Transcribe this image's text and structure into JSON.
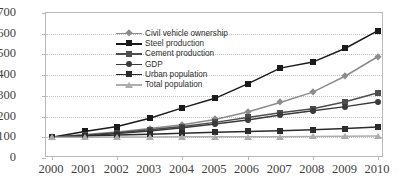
{
  "chart_data": {
    "type": "line",
    "title": "",
    "subtitle": "",
    "xlabel": "",
    "ylabel": "",
    "grid": true,
    "legend_position": "top-left inside plot",
    "x": [
      "2000",
      "2001",
      "2002",
      "2003",
      "2004",
      "2005",
      "2006",
      "2007",
      "2008",
      "2009",
      "2010"
    ],
    "categories": [
      "2000",
      "2001",
      "2002",
      "2003",
      "2004",
      "2005",
      "2006",
      "2007",
      "2008",
      "2009",
      "2010"
    ],
    "xlim": [
      2000,
      2010
    ],
    "ylim": [
      0,
      700
    ],
    "ytick_labels": [
      "700",
      "600",
      "500",
      "400",
      "300",
      "200",
      "100",
      "0"
    ],
    "ytick_values": [
      700,
      600,
      500,
      400,
      300,
      200,
      100,
      0
    ],
    "series": [
      {
        "name": "Civil vehicle ownership",
        "marker": "diamond",
        "color": "#8c8c8c",
        "values": [
          100,
          113,
          126,
          142,
          161,
          186,
          222,
          268,
          318,
          396,
          490
        ]
      },
      {
        "name": "Steel production",
        "marker": "square",
        "color": "#1a1a1a",
        "values": [
          100,
          128,
          152,
          192,
          242,
          288,
          358,
          434,
          463,
          530,
          615
        ]
      },
      {
        "name": "Cement production",
        "marker": "square",
        "color": "#4d4d4d",
        "values": [
          100,
          110,
          122,
          136,
          152,
          172,
          196,
          218,
          238,
          272,
          315
        ]
      },
      {
        "name": "GDP",
        "marker": "circle",
        "color": "#3a3a3a",
        "values": [
          100,
          108,
          118,
          130,
          146,
          164,
          184,
          208,
          228,
          248,
          272
        ]
      },
      {
        "name": "Urban population",
        "marker": "square",
        "color": "#2b2b2b",
        "values": [
          100,
          106,
          111,
          115,
          120,
          124,
          128,
          132,
          136,
          142,
          150
        ]
      },
      {
        "name": "Total population",
        "marker": "triangle",
        "color": "#adadad",
        "values": [
          100,
          100,
          101,
          101,
          102,
          102,
          103,
          103,
          104,
          105,
          106
        ]
      }
    ]
  },
  "legend": {
    "items": [
      {
        "label": "Civil vehicle ownership"
      },
      {
        "label": "Steel production"
      },
      {
        "label": "Cement production"
      },
      {
        "label": "GDP"
      },
      {
        "label": "Urban population"
      },
      {
        "label": "Total population"
      }
    ]
  },
  "axes": {
    "y_ticks": [
      "700",
      "600",
      "500",
      "400",
      "300",
      "200",
      "100",
      "0"
    ],
    "x_ticks": [
      "2000",
      "2001",
      "2002",
      "2003",
      "2004",
      "2005",
      "2006",
      "2007",
      "2008",
      "2009",
      "2010"
    ]
  },
  "colors": {
    "grid": "#c2c2c2",
    "frame": "#b9b9b9",
    "background": "#ffffff",
    "text": "#3f3f3f"
  }
}
